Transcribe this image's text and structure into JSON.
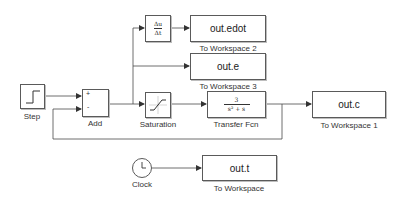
{
  "diagram": {
    "type": "simulink_model",
    "blocks": {
      "step": {
        "label": "Step"
      },
      "add": {
        "label": "Add",
        "ports": {
          "plus": "+",
          "minus": "-"
        }
      },
      "derivative": {
        "numerator": "Δu",
        "denominator": "Δt"
      },
      "to_workspace_2": {
        "variable": "out.edot",
        "label": "To Workspace 2"
      },
      "to_workspace_3": {
        "variable": "out.e",
        "label": "To Workspace 3"
      },
      "saturation": {
        "label": "Saturation"
      },
      "transfer_fcn": {
        "numerator": "3",
        "denominator": "s² + s",
        "label": "Transfer Fcn"
      },
      "to_workspace_1": {
        "variable": "out.c",
        "label": "To Workspace 1"
      },
      "clock": {
        "label": "Clock"
      },
      "to_workspace": {
        "variable": "out.t",
        "label": "To Workspace"
      }
    },
    "connections": [
      {
        "from": "Step",
        "to": "Add (+)"
      },
      {
        "from": "Add",
        "to": "Saturation"
      },
      {
        "from": "Add",
        "to": "Derivative"
      },
      {
        "from": "Add",
        "to": "To Workspace 3"
      },
      {
        "from": "Derivative",
        "to": "To Workspace 2"
      },
      {
        "from": "Saturation",
        "to": "Transfer Fcn"
      },
      {
        "from": "Transfer Fcn",
        "to": "To Workspace 1"
      },
      {
        "from": "Transfer Fcn",
        "to": "Add (-)"
      },
      {
        "from": "Clock",
        "to": "To Workspace"
      }
    ],
    "colors": {
      "line": "#4a4a4a",
      "block_border": "#5a5a5a",
      "text": "#222222"
    }
  }
}
